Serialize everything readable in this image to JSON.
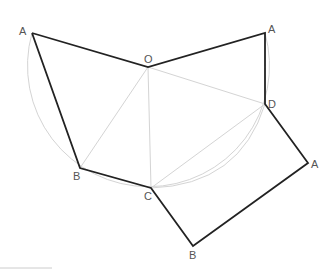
{
  "diagram": {
    "title": "",
    "colors": {
      "edge": "#222222",
      "construction": "#d0d0d0",
      "label": "#555555",
      "background": "#ffffff"
    },
    "points": {
      "A1": {
        "label": "A",
        "x": 32,
        "y": 33
      },
      "O": {
        "label": "O",
        "x": 148,
        "y": 67
      },
      "A2": {
        "label": "A",
        "x": 265,
        "y": 33
      },
      "D": {
        "label": "D",
        "x": 265,
        "y": 104
      },
      "A3": {
        "label": "A",
        "x": 308,
        "y": 163
      },
      "B2": {
        "label": "B",
        "x": 193,
        "y": 246
      },
      "C": {
        "label": "C",
        "x": 151,
        "y": 188
      },
      "B1": {
        "label": "B",
        "x": 80,
        "y": 168
      }
    },
    "labels": [
      {
        "id": "A1",
        "text": "A",
        "x": 19,
        "y": 35
      },
      {
        "id": "O",
        "text": "O",
        "x": 144,
        "y": 63
      },
      {
        "id": "A2",
        "text": "A",
        "x": 268,
        "y": 33
      },
      {
        "id": "D",
        "text": "D",
        "x": 268,
        "y": 108
      },
      {
        "id": "A3",
        "text": "A",
        "x": 311,
        "y": 168
      },
      {
        "id": "B2",
        "text": "B",
        "x": 189,
        "y": 259
      },
      {
        "id": "C",
        "text": "C",
        "x": 144,
        "y": 200
      },
      {
        "id": "B1",
        "text": "B",
        "x": 73,
        "y": 180
      }
    ],
    "polyline": "A1-O-A2-D-A3-B2-C-B1-A1",
    "construction_lines": [
      "O-B1",
      "O-C",
      "O-D",
      "C-D"
    ],
    "arcs": [
      {
        "center": "O",
        "radius": 121,
        "from": "A1",
        "to": "A2",
        "note": "lower arc through B, C, D"
      },
      {
        "from": "C",
        "to": "D",
        "note": "inner arc C to D"
      }
    ]
  }
}
